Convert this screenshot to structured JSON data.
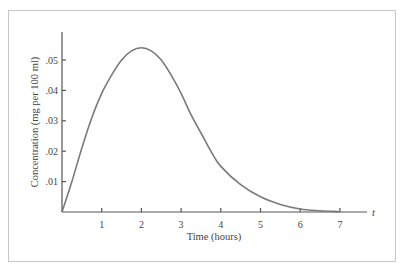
{
  "chart_data": {
    "type": "line",
    "title": "",
    "xlabel": "Time (hours)",
    "ylabel": "Concentration (mg per 100 ml)",
    "x_axis_var": "t",
    "xlim": [
      0,
      7.5
    ],
    "ylim": [
      0,
      0.058
    ],
    "grid": false,
    "legend": null,
    "x_ticks": [
      "1",
      "2",
      "3",
      "4",
      "5",
      "6",
      "7"
    ],
    "y_ticks": [
      ".01",
      ".02",
      ".03",
      ".04",
      ".05"
    ],
    "series": [
      {
        "name": "concentration",
        "color": "#7a7a7a",
        "x": [
          0,
          0.25,
          0.5,
          0.75,
          1,
          1.25,
          1.5,
          1.75,
          2,
          2.25,
          2.5,
          2.75,
          3,
          3.25,
          3.5,
          3.75,
          4,
          4.5,
          5,
          5.5,
          6,
          6.5,
          7
        ],
        "y": [
          0,
          0.01,
          0.021,
          0.031,
          0.039,
          0.045,
          0.05,
          0.053,
          0.054,
          0.053,
          0.05,
          0.045,
          0.039,
          0.032,
          0.026,
          0.02,
          0.015,
          0.009,
          0.005,
          0.0025,
          0.001,
          0.0004,
          0.0001
        ]
      }
    ]
  },
  "labels": {
    "xlabel": "Time (hours)",
    "ylabel": "Concentration (mg per 100 ml)",
    "t_label": "t"
  }
}
